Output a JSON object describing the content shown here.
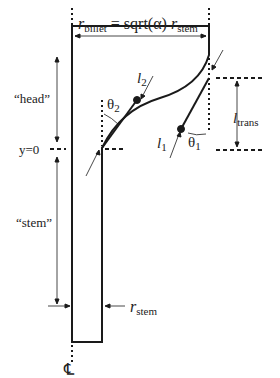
{
  "labels": {
    "r_billet": "r",
    "r_billet_sub": "billet",
    "equals_sqrt": " = sqrt(α) ",
    "r_stem_top": "r",
    "r_stem_top_sub": "stem",
    "head": "“head”",
    "stem": "“stem”",
    "y0": "y=0",
    "l2": "l",
    "l2_sub": "2",
    "theta2": "θ",
    "theta2_sub": "2",
    "l1": "l",
    "l1_sub": "1",
    "theta1": "θ",
    "theta1_sub": "1",
    "ltrans": "l",
    "ltrans_sub": "trans",
    "r_stem": "r",
    "r_stem_sub": "stem",
    "centerline": "℄"
  },
  "colors": {
    "line": "#1a1a1a",
    "text": "#222222"
  }
}
